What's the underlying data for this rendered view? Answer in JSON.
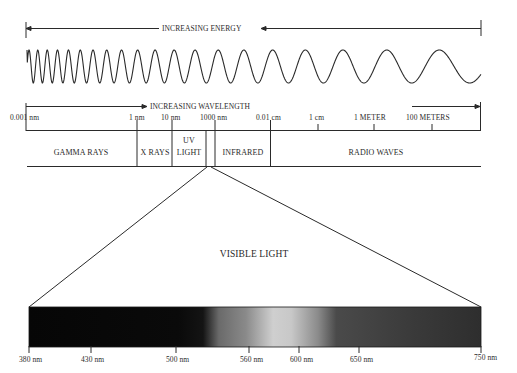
{
  "energy_axis": {
    "label": "INCREASING ENERGY",
    "direction": "left"
  },
  "wavelength_axis": {
    "label": "INCREASING WAVELENGTH",
    "direction": "right",
    "ticks": [
      {
        "label": "0.001 nm",
        "x": 26
      },
      {
        "label": "1 nm",
        "x": 137
      },
      {
        "label": "10 nm",
        "x": 172
      },
      {
        "label": "1000 nm",
        "x": 215
      },
      {
        "label": "0.01 cm",
        "x": 270
      },
      {
        "label": "1 cm",
        "x": 318
      },
      {
        "label": "1 METER",
        "x": 374
      },
      {
        "label": "100 METERS",
        "x": 432
      }
    ]
  },
  "bands": [
    {
      "label": "GAMMA RAYS",
      "x": 81
    },
    {
      "label": "X RAYS",
      "x": 154
    },
    {
      "label": "UV",
      "label2": "LIGHT",
      "x": 189
    },
    {
      "label": "INFRARED",
      "x": 242
    },
    {
      "label": "RADIO WAVES",
      "x": 375
    }
  ],
  "visible": {
    "title": "VISIBLE LIGHT",
    "ticks": [
      {
        "label": "380 nm",
        "x": 29
      },
      {
        "label": "430 nm",
        "x": 91
      },
      {
        "label": "500 nm",
        "x": 176
      },
      {
        "label": "560 nm",
        "x": 249
      },
      {
        "label": "600 nm",
        "x": 299
      },
      {
        "label": "650 nm",
        "x": 359
      },
      {
        "label": "750 nm",
        "x": 481
      }
    ]
  },
  "colors": {
    "line": "#2a2a2a",
    "spectrum_dark": "#0a0a0a",
    "spectrum_bright": "#d2d2d2"
  }
}
